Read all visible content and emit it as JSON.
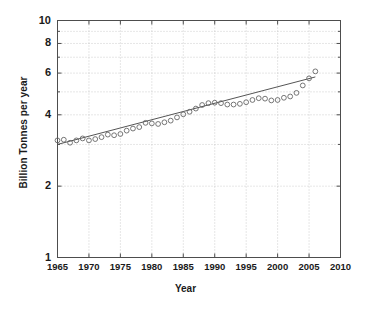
{
  "chart_data": {
    "type": "scatter",
    "title": "",
    "xlabel": "Year",
    "ylabel": "Billion Tonnes per year",
    "xlim": [
      1965,
      2010
    ],
    "ylim": [
      1,
      10
    ],
    "yscale": "log",
    "xscale": "linear",
    "grid": true,
    "legend": null,
    "xticks": [
      1965,
      1970,
      1975,
      1980,
      1985,
      1990,
      1995,
      2000,
      2005,
      2010
    ],
    "xtick_labels": [
      "1965",
      "1970",
      "1975",
      "1980",
      "1985",
      "1990",
      "1995",
      "2000",
      "2005",
      "2010"
    ],
    "yticks": [
      1,
      2,
      4,
      6,
      8,
      10
    ],
    "ytick_labels": [
      "1",
      "2",
      "4",
      "6",
      "8",
      "10"
    ],
    "marker": "open-circle",
    "marker_color": "#666666",
    "series": [
      {
        "name": "Global carbon emissions",
        "x": [
          1965,
          1966,
          1967,
          1968,
          1969,
          1970,
          1971,
          1972,
          1973,
          1974,
          1975,
          1976,
          1977,
          1978,
          1979,
          1980,
          1981,
          1982,
          1983,
          1984,
          1985,
          1986,
          1987,
          1988,
          1989,
          1990,
          1991,
          1992,
          1993,
          1994,
          1995,
          1996,
          1997,
          1998,
          1999,
          2000,
          2001,
          2002,
          2003,
          2004,
          2005,
          2006
        ],
        "y": [
          3.12,
          3.14,
          3.05,
          3.12,
          3.18,
          3.12,
          3.16,
          3.22,
          3.3,
          3.28,
          3.32,
          3.43,
          3.5,
          3.55,
          3.7,
          3.68,
          3.66,
          3.72,
          3.78,
          3.9,
          4.02,
          4.12,
          4.25,
          4.4,
          4.48,
          4.5,
          4.48,
          4.42,
          4.42,
          4.45,
          4.52,
          4.62,
          4.7,
          4.68,
          4.6,
          4.62,
          4.72,
          4.78,
          4.95,
          5.32,
          5.7,
          6.1
        ]
      }
    ],
    "trendline": {
      "name": "linear fit",
      "x": [
        1965,
        2006
      ],
      "y": [
        3.0,
        5.78
      ]
    }
  },
  "axes": {
    "y_label": "Billion Tonnes per year",
    "x_label": "Year"
  }
}
